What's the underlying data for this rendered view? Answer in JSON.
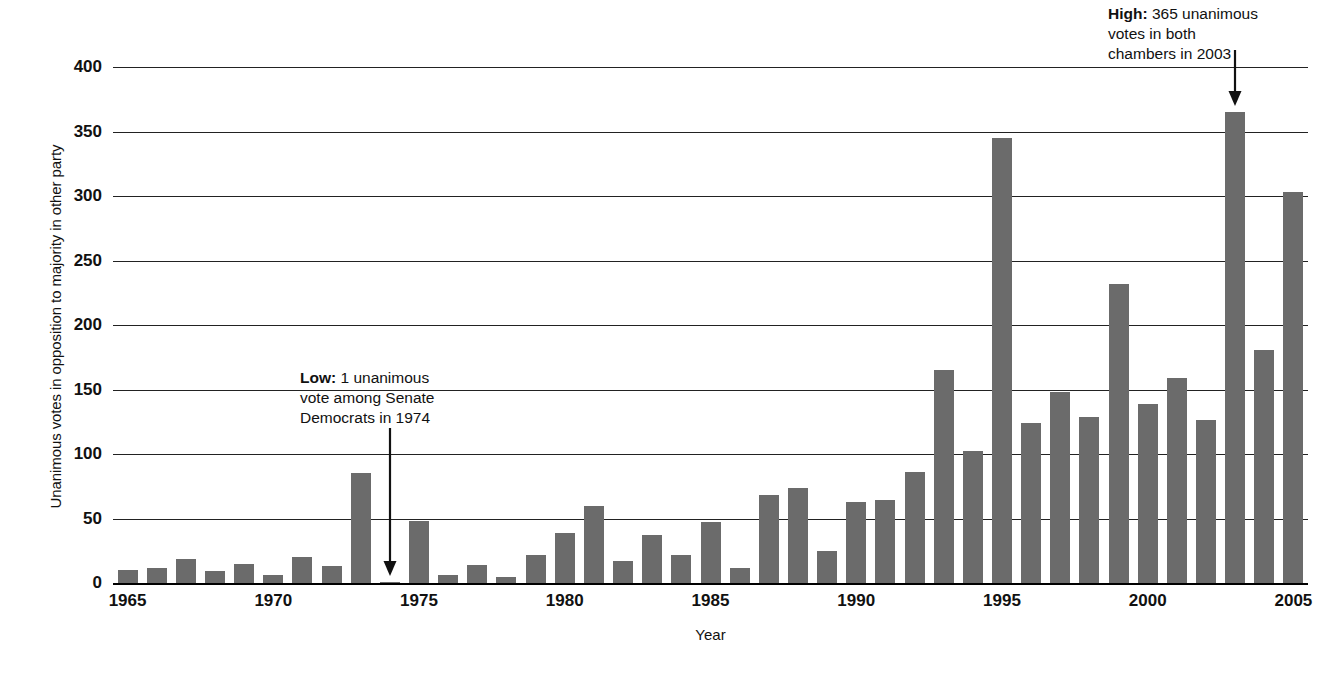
{
  "chart_data": {
    "type": "bar",
    "title": "",
    "xlabel": "Year",
    "ylabel": "Unanimous votes in opposition to majority in other party",
    "ylim": [
      0,
      400
    ],
    "ytick_step": 50,
    "yticks": [
      0,
      50,
      100,
      150,
      200,
      250,
      300,
      350,
      400
    ],
    "xticks": [
      1965,
      1970,
      1975,
      1980,
      1985,
      1990,
      1995,
      2000,
      2005
    ],
    "xlim": [
      1964.5,
      2005.5
    ],
    "grid": "horizontal",
    "legend": "none",
    "bar_color": "#6b6b6b",
    "categories": [
      1965,
      1966,
      1967,
      1968,
      1969,
      1970,
      1971,
      1972,
      1973,
      1974,
      1975,
      1976,
      1977,
      1978,
      1979,
      1980,
      1981,
      1982,
      1983,
      1984,
      1985,
      1986,
      1987,
      1988,
      1989,
      1990,
      1991,
      1992,
      1993,
      1994,
      1995,
      1996,
      1997,
      1998,
      1999,
      2000,
      2001,
      2002,
      2003,
      2004,
      2005
    ],
    "values": [
      10,
      12,
      19,
      9,
      15,
      6,
      20,
      13,
      85,
      1,
      48,
      6,
      14,
      5,
      22,
      39,
      60,
      17,
      37,
      22,
      47,
      12,
      68,
      74,
      25,
      63,
      64,
      86,
      165,
      102,
      345,
      124,
      148,
      129,
      232,
      139,
      159,
      126,
      365,
      181,
      303
    ],
    "annotations": [
      {
        "id": "high",
        "label_bold": "High:",
        "label_rest": " 365 unanimous votes in both chambers in 2003",
        "text": "High: 365 unanimous votes in both chambers in 2003",
        "points_to_year": 2003,
        "points_to_value": 365
      },
      {
        "id": "low",
        "label_bold": "Low:",
        "label_rest": " 1 unanimous vote among Senate Democrats in 1974",
        "text": "Low: 1 unanimous vote among Senate Democrats in 1974",
        "points_to_year": 1974,
        "points_to_value": 1
      }
    ]
  },
  "axes": {
    "y_title": "Unanimous votes in opposition to majority in other party",
    "x_title": "Year"
  },
  "annotation_high": {
    "bold": "High:",
    "rest": " 365 unanimous",
    "line2": "votes in both",
    "line3": "chambers in 2003"
  },
  "annotation_low": {
    "bold": "Low:",
    "rest": " 1 unanimous",
    "line2": "vote among Senate",
    "line3": "Democrats in 1974"
  }
}
